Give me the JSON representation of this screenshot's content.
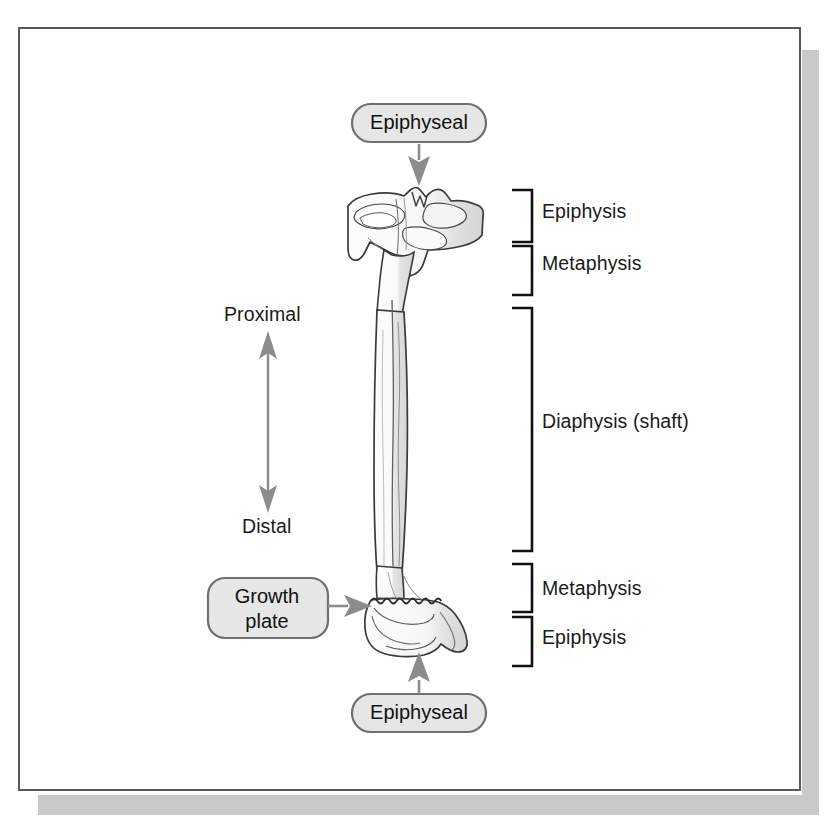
{
  "figure": {
    "background_color": "#ffffff",
    "frame_border_color": "#595959",
    "shadow_color": "#c9c9c9"
  },
  "bracket_labels": [
    {
      "id": "epiphysis-proximal",
      "label": "Epiphysis"
    },
    {
      "id": "metaphysis-proximal",
      "label": "Metaphysis"
    },
    {
      "id": "diaphysis",
      "label": "Diaphysis (shaft)"
    },
    {
      "id": "metaphysis-distal",
      "label": "Metaphysis"
    },
    {
      "id": "epiphysis-distal",
      "label": "Epiphysis"
    }
  ],
  "orientation_axis": {
    "top_label": "Proximal",
    "bottom_label": "Distal",
    "arrow_color": "#8c8c8c",
    "arrow_style": "double-headed-vertical"
  },
  "callouts": [
    {
      "id": "epiphyseal-top",
      "label": "Epiphyseal",
      "shape": "pill",
      "fill": "#e6e6e6",
      "border": "#7a7a7a",
      "arrow_direction": "down"
    },
    {
      "id": "growth-plate",
      "label": "Growth\nplate",
      "line1": "Growth",
      "line2": "plate",
      "shape": "rounded-rect",
      "fill": "#e6e6e6",
      "border": "#7a7a7a",
      "arrow_direction": "right"
    },
    {
      "id": "epiphyseal-bottom",
      "label": "Epiphyseal",
      "shape": "pill",
      "fill": "#e6e6e6",
      "border": "#7a7a7a",
      "arrow_direction": "up"
    }
  ],
  "bone_illustration": {
    "name": "tibia-bone-illustration",
    "outline_color": "#3a3a3a",
    "fill_light": "#fbfbfb",
    "fill_shade": "#dcdcdc",
    "growth_plate_line": "wavy-horizontal"
  }
}
